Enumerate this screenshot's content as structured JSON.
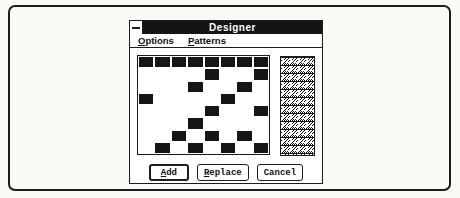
{
  "colors": {
    "page_bg": "#fbfaf7",
    "frame": "#1c1c1c",
    "window_bg": "#ffffff",
    "titlebar_bg": "#141414",
    "titlebar_text": "#ffffff",
    "pattern_on": "#161616"
  },
  "window": {
    "title": "Designer",
    "menus": [
      {
        "accel": "O",
        "rest": "ptions"
      },
      {
        "accel": "P",
        "rest": "atterns"
      }
    ],
    "buttons": [
      {
        "accel": "A",
        "rest": "dd",
        "default": true
      },
      {
        "accel": "R",
        "rest": "eplace",
        "default": false
      },
      {
        "accel": "",
        "rest": "Cancel",
        "default": false
      }
    ]
  },
  "pattern_grid": {
    "rows": 8,
    "cols": 8,
    "cells": [
      [
        1,
        1,
        1,
        1,
        1,
        1,
        1,
        1
      ],
      [
        0,
        0,
        0,
        0,
        1,
        0,
        0,
        1
      ],
      [
        0,
        0,
        0,
        1,
        0,
        0,
        1,
        0
      ],
      [
        1,
        0,
        0,
        0,
        0,
        1,
        0,
        0
      ],
      [
        0,
        0,
        0,
        0,
        1,
        0,
        0,
        1
      ],
      [
        0,
        0,
        0,
        1,
        0,
        0,
        0,
        0
      ],
      [
        0,
        0,
        1,
        0,
        1,
        0,
        1,
        0
      ],
      [
        0,
        1,
        0,
        1,
        0,
        1,
        0,
        1
      ]
    ]
  },
  "preview": {
    "tile_size": 8,
    "pixels_per_cell": 1
  }
}
